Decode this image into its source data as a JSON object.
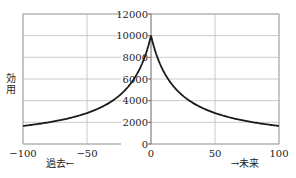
{
  "chart_data": {
    "type": "line",
    "title": "",
    "xlabel_left": "過去←",
    "xlabel_right": "→未来",
    "ylabel": "効用",
    "xlim": [
      -100,
      100
    ],
    "ylim": [
      0,
      12000
    ],
    "grid": true,
    "legend": "none",
    "x_ticks": [
      -100,
      -50,
      0,
      50,
      100
    ],
    "x_tick_labels": [
      "−100",
      "−50",
      "0",
      "50",
      "100"
    ],
    "y_ticks": [
      0,
      2000,
      4000,
      6000,
      8000,
      10000,
      12000
    ],
    "y_tick_labels": [
      "0",
      "2000",
      "4000",
      "6000",
      "8000",
      "10000",
      "12000"
    ],
    "y_axis_position": "x=0",
    "series": [
      {
        "name": "効用",
        "color": "#1a1a1a",
        "x": [
          -100,
          -90,
          -80,
          -70,
          -60,
          -50,
          -40,
          -30,
          -20,
          -10,
          -5,
          0,
          5,
          10,
          20,
          30,
          40,
          50,
          60,
          70,
          80,
          90,
          100
        ],
        "y": [
          1667,
          1818,
          2000,
          2222,
          2500,
          2857,
          3333,
          4000,
          5000,
          6667,
          8000,
          10000,
          8000,
          6667,
          5000,
          4000,
          3333,
          2857,
          2500,
          2222,
          2000,
          1818,
          1667
        ]
      }
    ]
  }
}
